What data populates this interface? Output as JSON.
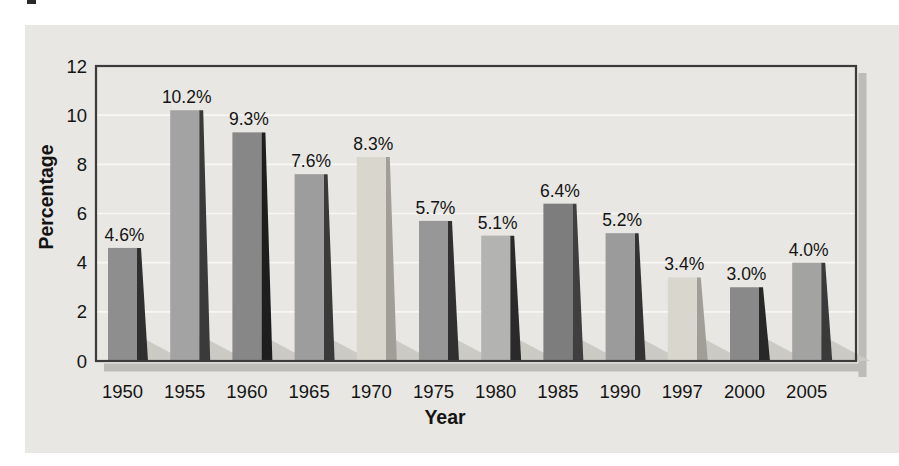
{
  "chart_data": {
    "type": "bar",
    "title": "",
    "xlabel": "Year",
    "ylabel": "Percentage",
    "categories": [
      "1950",
      "1955",
      "1960",
      "1965",
      "1970",
      "1975",
      "1980",
      "1985",
      "1990",
      "1997",
      "2000",
      "2005"
    ],
    "values": [
      4.6,
      10.2,
      9.3,
      7.6,
      8.3,
      5.7,
      5.1,
      6.4,
      5.2,
      3.4,
      3.0,
      4.0
    ],
    "value_labels": [
      "4.6%",
      "10.2%",
      "9.3%",
      "7.6%",
      "8.3%",
      "5.7%",
      "5.1%",
      "6.4%",
      "5.2%",
      "3.4%",
      "3.0%",
      "4.0%"
    ],
    "ylim": [
      0,
      12
    ],
    "yticks": [
      0,
      2,
      4,
      6,
      8,
      10,
      12
    ],
    "grid": true,
    "legend": "none",
    "bar_face_colors": [
      "#8e8e8e",
      "#a3a3a3",
      "#878787",
      "#9d9d9d",
      "#d9d6cd",
      "#979797",
      "#b3b3b1",
      "#7d7d7d",
      "#9b9b9b",
      "#d9d6cd",
      "#898989",
      "#a3a3a1"
    ],
    "bar_side_colors": [
      "#2f2f2f",
      "#3a3a3a",
      "#1e1e1e",
      "#3a3a3a",
      "#a09e96",
      "#303030",
      "#2a2a2a",
      "#3f3f3f",
      "#333333",
      "#a09e96",
      "#282828",
      "#3a3a3a"
    ],
    "colors": {
      "page_background": "#ffffff",
      "panel_background": "#e8e7e3",
      "frame_stroke": "#3b3b3b",
      "frame_drop_shadow": "#bdbcb8",
      "gridline": "#f8f7f4",
      "floor_shadow": "#cbcac5",
      "text": "#141414",
      "scan_artifact": "#2a2a2a"
    }
  }
}
